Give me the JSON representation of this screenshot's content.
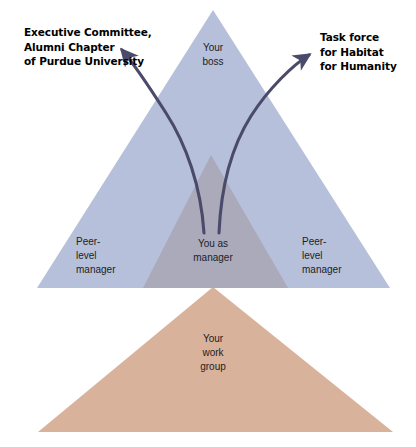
{
  "diagram": {
    "type": "nested-triangle-org-diagram",
    "canvas": {
      "width": 416,
      "height": 447,
      "background": "#ffffff"
    },
    "colors": {
      "outer_triangle": "#b6c0da",
      "inner_triangle": "#a9a8b8",
      "base_triangle": "#d9b29c",
      "arrow_stroke": "#4a4a6a",
      "callout_text": "#000000",
      "zone_text": "#221d24"
    },
    "callouts": [
      {
        "id": "executive-committee",
        "text": "Executive Committee,\nAlumni Chapter\nof Purdue University",
        "arrow_direction": "points-up-left"
      },
      {
        "id": "task-force",
        "text": "Task force\nfor Habitat\nfor Humanity",
        "arrow_direction": "points-up-right"
      }
    ],
    "zones": [
      {
        "id": "your-boss",
        "text": "Your\nboss",
        "region": "upper-triangle"
      },
      {
        "id": "peer-level-manager-left",
        "text": "Peer-\nlevel\nmanager",
        "region": "left-flank"
      },
      {
        "id": "you-as-manager",
        "text": "You as\nmanager",
        "region": "center-inner-triangle"
      },
      {
        "id": "peer-level-manager-right",
        "text": "Peer-\nlevel\nmanager",
        "region": "right-flank"
      },
      {
        "id": "your-work-group",
        "text": "Your\nwork\ngroup",
        "region": "lower-triangle"
      }
    ]
  }
}
